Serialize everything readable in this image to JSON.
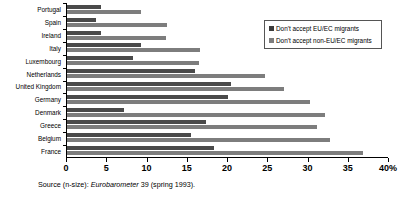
{
  "chart_data": {
    "type": "bar",
    "orientation": "horizontal",
    "title": "",
    "xlabel": "",
    "ylabel": "",
    "xlim": [
      0,
      40
    ],
    "xticks": [
      0,
      5,
      10,
      15,
      20,
      25,
      30,
      35,
      40
    ],
    "xtick_labels": [
      "0",
      "5",
      "10",
      "15",
      "20",
      "25",
      "30",
      "35",
      "40%"
    ],
    "grid": false,
    "legend_position": "top-right",
    "categories": [
      "Portugal",
      "Spain",
      "Ireland",
      "Italy",
      "Luxembourg",
      "Netherlands",
      "United Kingdom",
      "Germany",
      "Denmark",
      "Greece",
      "Belgium",
      "France"
    ],
    "series": [
      {
        "name": "Don't accept EU/EC migrants",
        "color": "#4a4a4a",
        "values": [
          4.2,
          3.6,
          4.2,
          9.2,
          8.2,
          16.0,
          20.4,
          20.1,
          7.1,
          17.3,
          15.4,
          18.3
        ]
      },
      {
        "name": "Don't accept non-EU/EC migrants",
        "color": "#7d7d7d",
        "values": [
          9.2,
          12.5,
          12.3,
          16.6,
          16.5,
          24.7,
          27.0,
          30.3,
          32.2,
          31.2,
          32.8,
          36.9
        ]
      }
    ]
  },
  "legend": {
    "items": [
      {
        "label": "Don't accept EU/EC migrants",
        "color": "#3a3a3a"
      },
      {
        "label": "Don't accept non-EU/EC migrants",
        "color": "#7d7d7d"
      }
    ]
  },
  "source": {
    "prefix": "Source (n-size): ",
    "italic": "Eurobarometer",
    "suffix": " 39 (spring 1993)."
  }
}
